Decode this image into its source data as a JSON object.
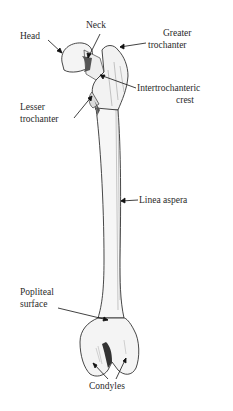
{
  "diagram": {
    "labels": {
      "head": "Head",
      "neck": "Neck",
      "greater_trochanter_1": "Greater",
      "greater_trochanter_2": "trochanter",
      "intertrochanteric_1": "Intertrochanteric",
      "intertrochanteric_2": "crest",
      "lesser_trochanter_1": "Lesser",
      "lesser_trochanter_2": "trochanter",
      "linea_aspera": "Linea aspera",
      "popliteal_1": "Popliteal",
      "popliteal_2": "surface",
      "condyles": "Condyles"
    },
    "colors": {
      "background": "#ffffff",
      "ink": "#222222",
      "shade": "#555555"
    }
  }
}
